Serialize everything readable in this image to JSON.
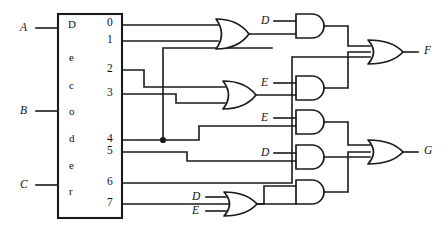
{
  "figure": {
    "kind": "logic-circuit-diagram",
    "line_color": "#1a1a1a",
    "background_color": "#ffffff"
  },
  "decoder": {
    "name_letters": [
      "D",
      "e",
      "c",
      "o",
      "d",
      "e",
      "r"
    ],
    "inputs": [
      {
        "label": "A",
        "x": 20,
        "y": 22
      },
      {
        "label": "B",
        "x": 20,
        "y": 105
      },
      {
        "label": "C",
        "x": 20,
        "y": 179
      }
    ],
    "outputs": [
      {
        "label": "0",
        "y": 25
      },
      {
        "label": "1",
        "y": 41
      },
      {
        "label": "2",
        "y": 70
      },
      {
        "label": "3",
        "y": 94
      },
      {
        "label": "4",
        "y": 140
      },
      {
        "label": "5",
        "y": 152
      },
      {
        "label": "6",
        "y": 183
      },
      {
        "label": "7",
        "y": 204
      }
    ]
  },
  "gate_inputs": {
    "and_top_d": "D",
    "and_mid_e": "E",
    "and_low_e": "E",
    "and_low_d": "D",
    "or_bottom_d": "D",
    "or_bottom_e": "E"
  },
  "outputs": [
    {
      "label": "F",
      "x": 418,
      "y": 44
    },
    {
      "label": "G",
      "x": 418,
      "y": 145
    }
  ],
  "gates": [
    {
      "id": "or1",
      "type": "OR",
      "inputs": [
        "0",
        "1"
      ],
      "note": "top OR gate"
    },
    {
      "id": "and1",
      "type": "AND",
      "inputs": [
        "or1",
        "D"
      ],
      "note": "top AND gate"
    },
    {
      "id": "or2",
      "type": "OR",
      "inputs": [
        "2",
        "3"
      ],
      "note": "second OR gate"
    },
    {
      "id": "and2",
      "type": "AND",
      "inputs": [
        "or2",
        "E"
      ],
      "note": "second AND gate"
    },
    {
      "id": "and3",
      "type": "AND",
      "inputs": [
        "4",
        "E"
      ],
      "note": "third AND gate"
    },
    {
      "id": "and4",
      "type": "AND",
      "inputs": [
        "5",
        "D"
      ],
      "note": "fourth AND gate"
    },
    {
      "id": "or3",
      "type": "OR",
      "inputs": [
        "D",
        "E"
      ],
      "note": "bottom OR gate"
    },
    {
      "id": "and5",
      "type": "AND",
      "inputs": [
        "7",
        "or3"
      ],
      "note": "bottom AND gate"
    },
    {
      "id": "orF",
      "type": "OR",
      "inputs": [
        "and1",
        "and2",
        "6"
      ],
      "note": "output OR gate for F"
    },
    {
      "id": "orG",
      "type": "OR",
      "inputs": [
        "and3",
        "and4",
        "and5"
      ],
      "note": "output OR gate for G"
    }
  ]
}
